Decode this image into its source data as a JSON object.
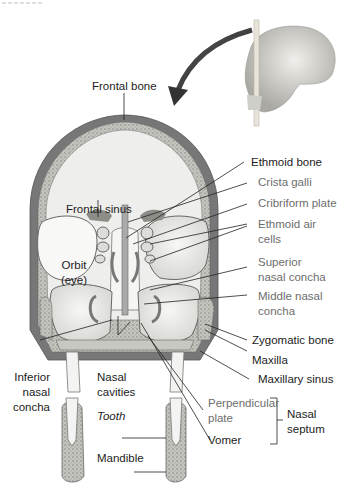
{
  "diagram": {
    "colors": {
      "bone_outer": "#7a7a7a",
      "bone_light": "#d8d8d4",
      "spongy": "#b0b0aa",
      "cavity": "#efefed",
      "label_dark": "#1c1c1c",
      "label_gray": "#6d6d6d",
      "leader": "#222222"
    },
    "labels": {
      "frontal_bone": "Frontal bone",
      "ethmoid_bone": "Ethmoid bone",
      "crista_galli": "Crista galli",
      "cribriform_plate": "Cribriform plate",
      "ethmoid_air_cells_1": "Ethmoid air",
      "ethmoid_air_cells_2": "cells",
      "superior_nasal_concha_1": "Superior",
      "superior_nasal_concha_2": "nasal concha",
      "middle_nasal_concha_1": "Middle nasal",
      "middle_nasal_concha_2": "concha",
      "zygomatic_bone": "Zygomatic bone",
      "maxilla": "Maxilla",
      "maxillary_sinus": "Maxillary sinus",
      "perpendicular_plate_1": "Perpendicular",
      "perpendicular_plate_2": "plate",
      "vomer": "Vomer",
      "nasal_septum_1": "Nasal",
      "nasal_septum_2": "septum",
      "frontal_sinus": "Frontal sinus",
      "orbit_1": "Orbit",
      "orbit_2": "(eye)",
      "inferior_nasal_concha_1": "Inferior",
      "inferior_nasal_concha_2": "nasal",
      "inferior_nasal_concha_3": "concha",
      "nasal_cavities_1": "Nasal",
      "nasal_cavities_2": "cavities",
      "tooth": "Tooth",
      "mandible": "Mandible"
    }
  }
}
